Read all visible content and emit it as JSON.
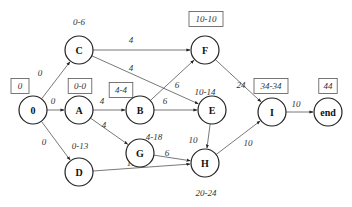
{
  "diagram": {
    "type": "activity-network",
    "nodes": [
      {
        "id": "0",
        "label": "0",
        "x": 33,
        "y": 110
      },
      {
        "id": "A",
        "label": "A",
        "x": 79,
        "y": 110
      },
      {
        "id": "B",
        "label": "B",
        "x": 140,
        "y": 110
      },
      {
        "id": "C",
        "label": "C",
        "x": 79,
        "y": 50
      },
      {
        "id": "D",
        "label": "D",
        "x": 79,
        "y": 172
      },
      {
        "id": "E",
        "label": "E",
        "x": 212,
        "y": 110
      },
      {
        "id": "F",
        "label": "F",
        "x": 205,
        "y": 50
      },
      {
        "id": "G",
        "label": "G",
        "x": 140,
        "y": 153
      },
      {
        "id": "H",
        "label": "H",
        "x": 205,
        "y": 163
      },
      {
        "id": "I",
        "label": "I",
        "x": 272,
        "y": 112
      },
      {
        "id": "end",
        "label": "end",
        "x": 328,
        "y": 112
      }
    ],
    "edges": [
      {
        "from": "0",
        "to": "C",
        "weight": "0",
        "lx": 40,
        "ly": 76
      },
      {
        "from": "0",
        "to": "A",
        "weight": "0",
        "lx": 53,
        "ly": 104
      },
      {
        "from": "0",
        "to": "D",
        "weight": "0",
        "lx": 44,
        "ly": 145
      },
      {
        "from": "C",
        "to": "F",
        "weight": "4",
        "lx": 131,
        "ly": 43
      },
      {
        "from": "C",
        "to": "E",
        "weight": "4",
        "lx": 131,
        "ly": 71
      },
      {
        "from": "A",
        "to": "B",
        "weight": "4",
        "lx": 102,
        "ly": 104
      },
      {
        "from": "A",
        "to": "G",
        "weight": "4",
        "lx": 104,
        "ly": 128
      },
      {
        "from": "D",
        "to": "H",
        "weight": "11",
        "lx": 131,
        "ly": 166
      },
      {
        "from": "B",
        "to": "F",
        "weight": "6",
        "lx": 177,
        "ly": 88
      },
      {
        "from": "B",
        "to": "E",
        "weight": "6",
        "lx": 165,
        "ly": 104
      },
      {
        "from": "G",
        "to": "H",
        "weight": "6",
        "lx": 167,
        "ly": 156
      },
      {
        "from": "E",
        "to": "H",
        "weight": "10",
        "lx": 193,
        "ly": 143
      },
      {
        "from": "F",
        "to": "I",
        "weight": "24",
        "lx": 241,
        "ly": 88
      },
      {
        "from": "H",
        "to": "I",
        "weight": "10",
        "lx": 248,
        "ly": 146
      },
      {
        "from": "I",
        "to": "end",
        "weight": "10",
        "lx": 296,
        "ly": 107
      }
    ],
    "time_labels": [
      {
        "node": "0",
        "text": "0",
        "boxed": true,
        "x": 20,
        "y": 86
      },
      {
        "node": "C",
        "text": "0-6",
        "boxed": false,
        "x": 79,
        "y": 22
      },
      {
        "node": "A",
        "text": "0-0",
        "boxed": true,
        "x": 80,
        "y": 86
      },
      {
        "node": "B",
        "text": "4-4",
        "boxed": true,
        "x": 121,
        "y": 90
      },
      {
        "node": "D",
        "text": "0-13",
        "boxed": false,
        "x": 80,
        "y": 146
      },
      {
        "node": "F",
        "text": "10-10",
        "boxed": true,
        "x": 206,
        "y": 19
      },
      {
        "node": "E",
        "text": "10-14",
        "boxed": false,
        "x": 205,
        "y": 92
      },
      {
        "node": "G",
        "text": "4-18",
        "boxed": false,
        "x": 154,
        "y": 137
      },
      {
        "node": "H",
        "text": "20-24",
        "boxed": false,
        "x": 206,
        "y": 193
      },
      {
        "node": "I",
        "text": "34-34",
        "boxed": true,
        "x": 271,
        "y": 86
      },
      {
        "node": "end",
        "text": "44",
        "boxed": true,
        "x": 328,
        "y": 86
      }
    ]
  }
}
